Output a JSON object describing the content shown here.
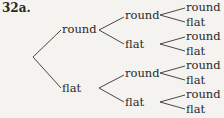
{
  "title": "32a.",
  "tree": {
    "root": "",
    "level1": [
      {
        "label": "round",
        "children": [
          {
            "label": "round",
            "children": [
              {
                "label": "round"
              },
              {
                "label": "flat"
              }
            ]
          },
          {
            "label": "flat",
            "children": [
              {
                "label": "round"
              },
              {
                "label": "flat"
              }
            ]
          }
        ]
      },
      {
        "label": "flat",
        "children": [
          {
            "label": "round",
            "children": [
              {
                "label": "round"
              },
              {
                "label": "flat"
              }
            ]
          },
          {
            "label": "flat",
            "children": [
              {
                "label": "round"
              },
              {
                "label": "flat"
              }
            ]
          }
        ]
      }
    ]
  }
}
